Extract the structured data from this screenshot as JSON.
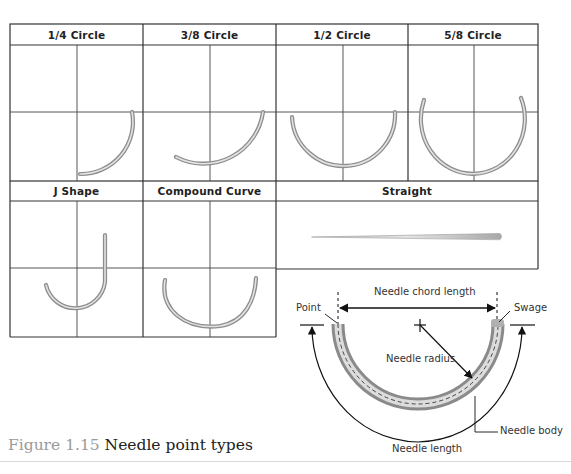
{
  "figure": {
    "number": "Figure 1.15",
    "title": "Needle point types"
  },
  "grid": {
    "row1": [
      {
        "label": "1/4 Circle",
        "shape": "quarter-circle-needle"
      },
      {
        "label": "3/8 Circle",
        "shape": "three-eighths-circle-needle"
      },
      {
        "label": "1/2 Circle",
        "shape": "half-circle-needle"
      },
      {
        "label": "5/8 Circle",
        "shape": "five-eighths-circle-needle"
      }
    ],
    "row2": [
      {
        "label": "J Shape",
        "shape": "j-shape-needle"
      },
      {
        "label": "Compound Curve",
        "shape": "compound-curve-needle"
      },
      {
        "label": "Straight",
        "shape": "straight-needle"
      }
    ]
  },
  "anatomy": {
    "chord_length": "Needle chord  length",
    "point": "Point",
    "swage": "Swage",
    "radius": "Needle radius",
    "body": "Needle body",
    "length": "Needle length"
  },
  "colors": {
    "grid_line": "#333333",
    "needle_light": "#e6e6e6",
    "needle_dark": "#8c8c8c",
    "caption_number": "#9a9a9a",
    "caption_text": "#222222"
  }
}
